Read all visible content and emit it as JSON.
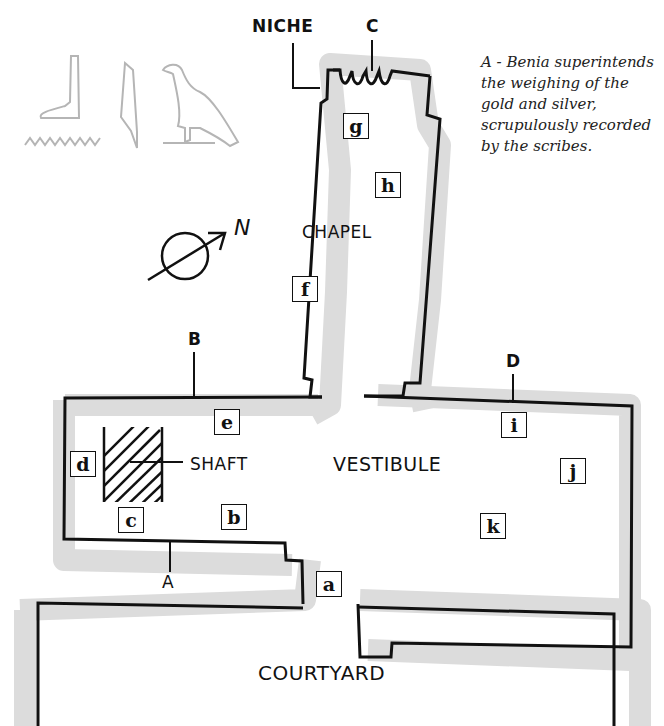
{
  "caption": {
    "lines": [
      "A - Benia superintends",
      "the weighing of the",
      "gold and silver,",
      "scrupulously recorded",
      "by the scribes."
    ]
  },
  "rooms": {
    "chapel": "CHAPEL",
    "vestibule": "VESTIBULE",
    "courtyard": "COURTYARD",
    "shaft": "SHAFT"
  },
  "callouts": {
    "niche": "NICHE",
    "A": "A",
    "B": "B",
    "C": "C",
    "D": "D"
  },
  "compass": {
    "north": "N"
  },
  "markers": {
    "a": "a",
    "b": "b",
    "c": "c",
    "d": "d",
    "e": "e",
    "f": "f",
    "g": "g",
    "h": "h",
    "i": "i",
    "j": "j",
    "k": "k"
  },
  "colors": {
    "wall": "#111111",
    "wall_shadow": "#dcdcdc",
    "hieroglyph": "#b5b5b5"
  }
}
